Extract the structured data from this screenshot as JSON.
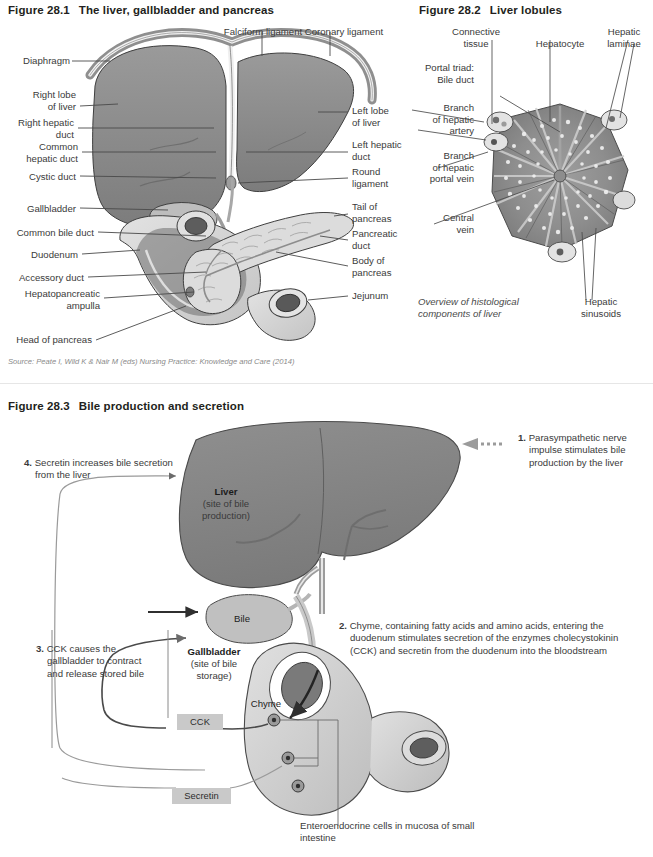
{
  "figure_28_1": {
    "number": "Figure 28.1",
    "title": "The liver, gallbladder and pancreas",
    "source": "Source: Peate I, Wild K & Nair M (eds) Nursing Practice: Knowledge and Care (2014)",
    "labels_top": [
      {
        "text": "Falciform ligament"
      },
      {
        "text": "Coronary ligament"
      }
    ],
    "labels_left": [
      {
        "text": "Diaphragm"
      },
      {
        "text": "Right lobe\nof liver"
      },
      {
        "text": "Right hepatic\nduct"
      },
      {
        "text": "Common\nhepatic duct"
      },
      {
        "text": "Cystic duct"
      },
      {
        "text": "Gallbladder"
      },
      {
        "text": "Common bile duct"
      },
      {
        "text": "Duodenum"
      },
      {
        "text": "Accessory duct"
      },
      {
        "text": "Hepatopancreatic\nampulla"
      },
      {
        "text": "Head of pancreas"
      }
    ],
    "labels_right": [
      {
        "text": "Left lobe\nof liver"
      },
      {
        "text": "Left hepatic\nduct"
      },
      {
        "text": "Round\nligament"
      },
      {
        "text": "Tail of\npancreas"
      },
      {
        "text": "Pancreatic\nduct"
      },
      {
        "text": "Body of\npancreas"
      },
      {
        "text": "Jejunum"
      }
    ]
  },
  "figure_28_2": {
    "number": "Figure 28.2",
    "title": "Liver lobules",
    "caption": "Overview of histological\ncomponents of liver",
    "labels_top": [
      {
        "text": "Connective\ntissue"
      },
      {
        "text": "Hepatocyte"
      },
      {
        "text": "Hepatic\nlaminae"
      }
    ],
    "labels_left": [
      {
        "text": "Portal triad:\n  Bile duct"
      },
      {
        "text": "Branch\nof hepatic\nartery"
      },
      {
        "text": "Branch\nof hepatic\nportal vein"
      },
      {
        "text": "Central\nvein"
      }
    ],
    "labels_bottom": [
      {
        "text": "Hepatic\nsinusoids"
      }
    ]
  },
  "figure_28_3": {
    "number": "Figure 28.3",
    "title": "Bile production and secretion",
    "steps": [
      {
        "num": "1.",
        "text": "Parasympathetic nerve impulse stimulates bile production by the liver"
      },
      {
        "num": "2.",
        "text": "Chyme, containing fatty acids and amino acids, entering the duodenum stimulates secretion of the enzymes cholecystokinin (CCK) and secretin from the duodenum into the bloodstream"
      },
      {
        "num": "3.",
        "text": "CCK causes the gallbladder to contract and release stored bile"
      },
      {
        "num": "4.",
        "text": "Secretin increases bile secretion from the liver"
      }
    ],
    "organ_labels": {
      "liver_name": "Liver",
      "liver_sub": "(site of bile\nproduction)",
      "bile": "Bile",
      "gallbladder_name": "Gallbladder",
      "gallbladder_sub": "(site of bile\nstorage)",
      "chyme": "Chyme"
    },
    "hormone_tags": [
      {
        "text": "CCK"
      },
      {
        "text": "Secretin"
      }
    ],
    "bottom_note": "Enteroendocrine cells in\nmucosa of small intestine"
  },
  "colors": {
    "liver_fill": "#8a8a8a",
    "liver_dark": "#6f6f6f",
    "organ_light": "#d6d6d6",
    "organ_mid": "#b5b5b5",
    "text": "#3a3a3a",
    "tag_bg": "#c9c9c9"
  }
}
